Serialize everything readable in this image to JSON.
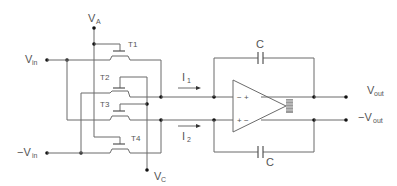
{
  "diagram": {
    "type": "circuit-schematic",
    "labels": {
      "va": "V",
      "va_sub": "A",
      "vc": "V",
      "vc_sub": "C",
      "vin": "V",
      "vin_sub": "in",
      "neg_vin_prefix": "−V",
      "neg_vin_sub": "in",
      "vout": "V",
      "vout_sub": "out",
      "neg_vout_prefix": "−V",
      "neg_vout_sub": "out",
      "i1": "I",
      "i1_sub": "1",
      "i2": "I",
      "i2_sub": "2",
      "cap_top": "C",
      "cap_bottom": "C",
      "t1": "T1",
      "t2": "T2",
      "t3": "T3",
      "t4": "T4",
      "opamp_top_left": "− +",
      "opamp_bottom_left": "+ −"
    },
    "components": [
      {
        "id": "T1",
        "kind": "transistor"
      },
      {
        "id": "T2",
        "kind": "transistor"
      },
      {
        "id": "T3",
        "kind": "transistor"
      },
      {
        "id": "T4",
        "kind": "transistor"
      },
      {
        "id": "C_top",
        "kind": "capacitor",
        "label": "C"
      },
      {
        "id": "C_bottom",
        "kind": "capacitor",
        "label": "C"
      },
      {
        "id": "OA",
        "kind": "fully-differential-op-amp"
      }
    ],
    "colors": {
      "wire": "#6b6b6b",
      "node": "#111111",
      "text": "#555555"
    }
  }
}
